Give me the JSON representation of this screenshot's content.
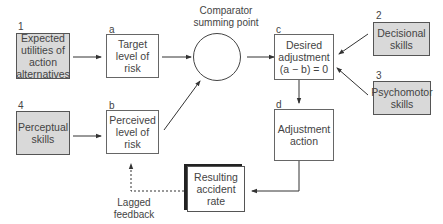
{
  "diagram": {
    "type": "flow-diagram",
    "nodes": {
      "n1": {
        "tag": "1",
        "text": "Expected utilities of action alternatives",
        "lines": [
          "Expected",
          "utilities of",
          "action",
          "alternatives"
        ],
        "style": "shaded"
      },
      "n4": {
        "tag": "4",
        "text": "Perceptual skills",
        "lines": [
          "Perceptual",
          "skills"
        ],
        "style": "shaded"
      },
      "a": {
        "tag": "a",
        "text": "Target level of risk",
        "lines": [
          "Target",
          "level of",
          "risk"
        ],
        "style": "plain"
      },
      "b": {
        "tag": "b",
        "text": "Perceived level of risk",
        "lines": [
          "Perceived",
          "level of",
          "risk"
        ],
        "style": "plain"
      },
      "comparator": {
        "label_lines": [
          "Comparator",
          "summing point"
        ],
        "shape": "circle"
      },
      "c": {
        "tag": "c",
        "text": "Desired adjustment (a − b) = 0",
        "lines": [
          "Desired",
          "adjustment",
          "(a − b) = 0"
        ],
        "style": "plain"
      },
      "d": {
        "tag": "d",
        "text": "Adjustment action",
        "lines": [
          "Adjustment",
          "action"
        ],
        "style": "plain"
      },
      "n2": {
        "tag": "2",
        "text": "Decisional skills",
        "lines": [
          "Decisional",
          "skills"
        ],
        "style": "shaded"
      },
      "n3": {
        "tag": "3",
        "text": "Psychomotor skills",
        "lines": [
          "Psychomotor",
          "skills"
        ],
        "style": "shaded"
      },
      "result": {
        "text": "Resulting accident rate",
        "lines": [
          "Resulting",
          "accident",
          "rate"
        ],
        "style": "heavy"
      }
    },
    "feedback_label_lines": [
      "Lagged",
      "feedback"
    ],
    "edges": [
      {
        "from": "n1",
        "to": "a",
        "style": "solid"
      },
      {
        "from": "n4",
        "to": "b",
        "style": "solid"
      },
      {
        "from": "a",
        "to": "comparator",
        "style": "solid"
      },
      {
        "from": "b",
        "to": "comparator",
        "style": "solid"
      },
      {
        "from": "comparator",
        "to": "c",
        "style": "solid"
      },
      {
        "from": "n2",
        "to": "c",
        "style": "solid"
      },
      {
        "from": "n3",
        "to": "c",
        "style": "solid"
      },
      {
        "from": "c",
        "to": "d",
        "style": "solid"
      },
      {
        "from": "d",
        "to": "result",
        "style": "solid"
      },
      {
        "from": "result",
        "to": "b",
        "style": "dashed",
        "label": "Lagged feedback"
      }
    ]
  }
}
